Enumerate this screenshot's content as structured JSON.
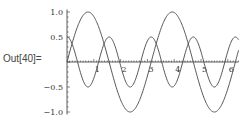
{
  "cell": {
    "label": "Out[40]="
  },
  "chart_data": {
    "type": "line",
    "title": "",
    "xlabel": "",
    "ylabel": "",
    "xlim": [
      0,
      6.4
    ],
    "ylim": [
      -1.0,
      1.0
    ],
    "grid": false,
    "x_ticks": [
      "1",
      "2",
      "3",
      "4",
      "5",
      "6"
    ],
    "y_ticks": [
      "1.0",
      "0.5",
      "-0.5",
      "-1.0"
    ],
    "series": [
      {
        "name": "sin(2x)",
        "formula": "sin(2x)",
        "color": "#555555"
      },
      {
        "name": "0.5 cos(4x)",
        "formula": "0.5*cos(4x)",
        "color": "#555555"
      }
    ]
  }
}
